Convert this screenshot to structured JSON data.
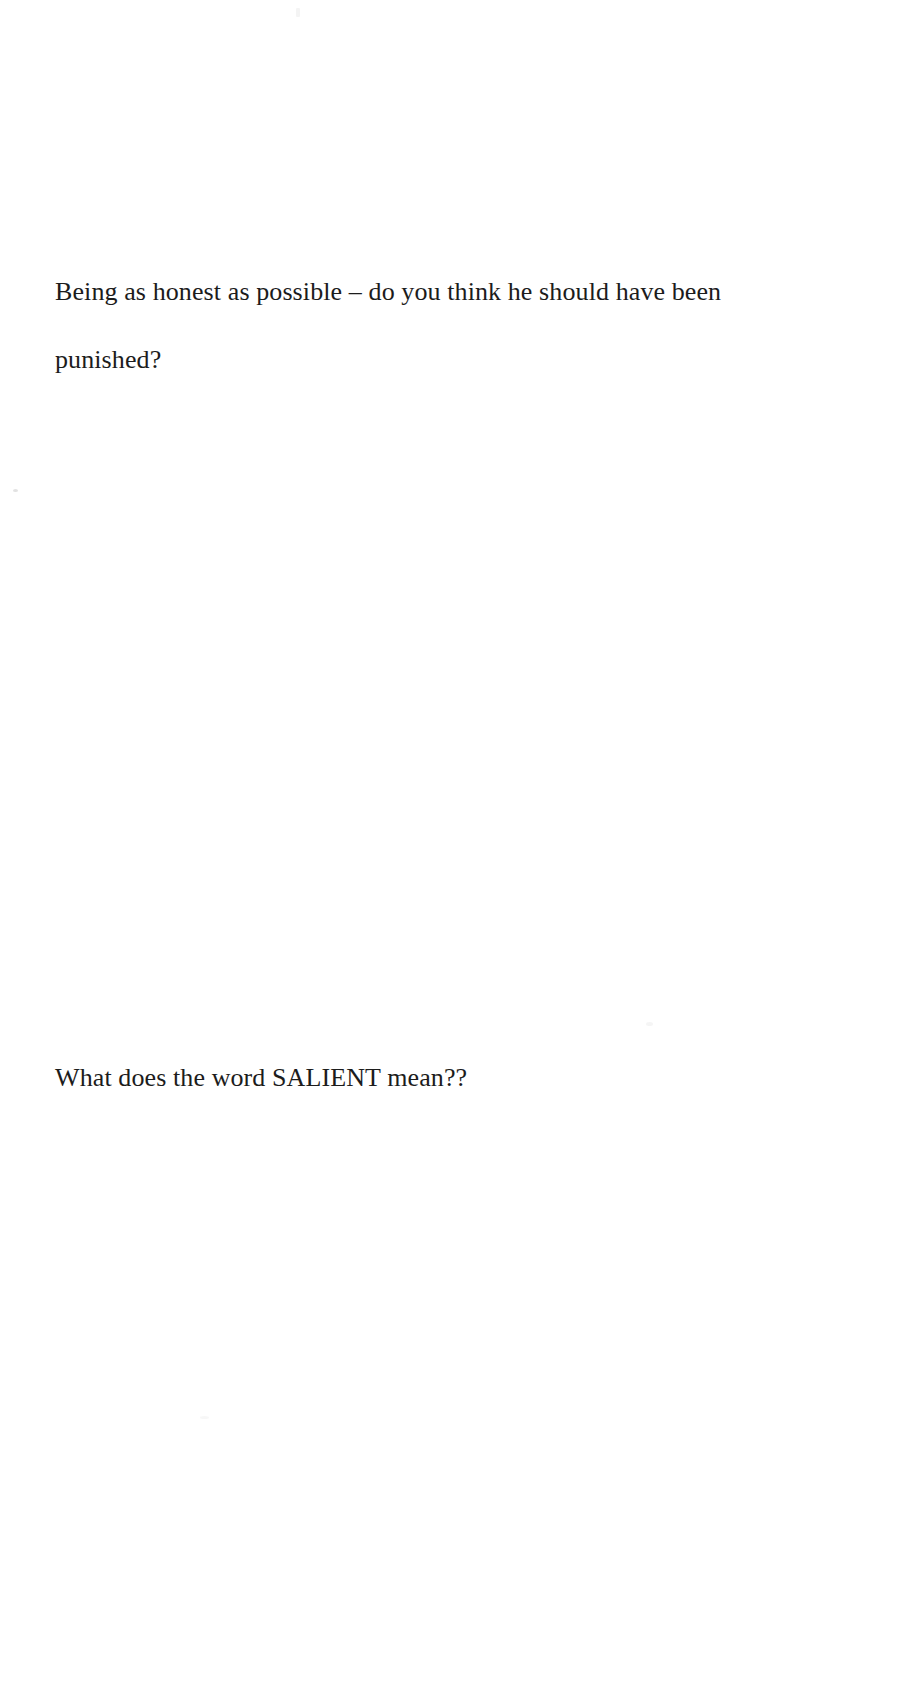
{
  "document": {
    "type": "scanned-page",
    "background_color": "#ffffff",
    "text_color": "#1c1c1c",
    "page_width": 912,
    "page_height": 1701,
    "blocks": [
      {
        "id": "question-one",
        "role": "question",
        "text": "Being as honest as possible – do you think he should have been punished?"
      },
      {
        "id": "question-two",
        "role": "question",
        "text": "What does the word SALIENT mean??"
      }
    ]
  },
  "artifacts": {
    "speck_left_margin": "scan-speck",
    "speck_top": "scan-speck",
    "speck_mid": "scan-speck",
    "speck_low": "scan-speck"
  }
}
